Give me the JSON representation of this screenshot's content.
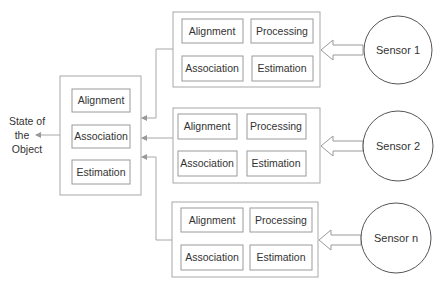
{
  "output": {
    "label_lines": [
      "State of",
      "the",
      "Object"
    ]
  },
  "fusion_center": {
    "blocks": [
      "Alignment",
      "Association",
      "Estimation"
    ]
  },
  "sensor_modules": [
    {
      "sensor_label": "Sensor 1",
      "blocks": [
        "Alignment",
        "Processing",
        "Association",
        "Estimation"
      ]
    },
    {
      "sensor_label": "Sensor 2",
      "blocks": [
        "Alignment",
        "Processing",
        "Association",
        "Estimation"
      ]
    },
    {
      "sensor_label": "Sensor n",
      "blocks": [
        "Alignment",
        "Processing",
        "Association",
        "Estimation"
      ]
    }
  ],
  "colors": {
    "box_stroke": "#a8a8a8",
    "circle_stroke": "#555555",
    "text": "#333333"
  }
}
